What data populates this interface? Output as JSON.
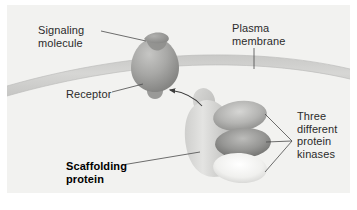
{
  "figure": {
    "background_color": "#ffffff",
    "panel_color": "#f2f2f0",
    "text_color": "#2b2b2b"
  },
  "labels": {
    "signaling_molecule": "Signaling\nmolecule",
    "plasma_membrane": "Plasma\nmembrane",
    "receptor": "Receptor",
    "three_kinases": "Three\ndifferent\nprotein\nkinases",
    "scaffolding_protein": "Scaffolding\nprotein"
  },
  "diagram": {
    "membrane": {
      "name": "plasma-membrane-band",
      "fill": "#d2d2d0",
      "edge": "#c2c2c0"
    },
    "receptor": {
      "name": "receptor-protein",
      "fill_light": "#b9b9b7",
      "fill_dark": "#8e8e8c"
    },
    "signaling_molecule": {
      "name": "signaling-molecule",
      "fill": "#9a9a98"
    },
    "scaffolding_protein": {
      "name": "scaffolding-protein-body",
      "fill_light": "#dedede",
      "fill_dark": "#b4b4b2"
    },
    "kinases": [
      {
        "name": "kinase-top",
        "fill_center": "#cdcdcb",
        "fill_edge": "#8d8d8b"
      },
      {
        "name": "kinase-middle",
        "fill_center": "#b2b2b0",
        "fill_edge": "#6e6e6c"
      },
      {
        "name": "kinase-bottom",
        "fill_center": "#fbfbfa",
        "fill_edge": "#cfcfcd"
      }
    ],
    "arrow": {
      "name": "activation-arrow",
      "color": "#4a4a4a",
      "direction": "scaffold-to-receptor"
    },
    "leader_line_color": "#4a4a4a"
  }
}
